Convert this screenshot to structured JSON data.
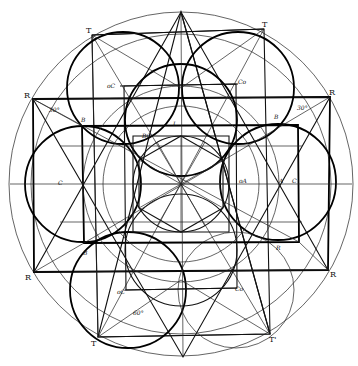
{
  "diagram": {
    "title": "",
    "type": "geometric construction",
    "stroke_color": "#000000",
    "background": "#ffffff",
    "labels": {
      "T_tl": "T",
      "T_tr": "T",
      "T_bl": "T",
      "T_br": "T'",
      "R_tl": "R",
      "R_tr": "R",
      "R_bl": "R",
      "R_br": "R",
      "B_tl": "B",
      "B_tr": "B",
      "B_bl": "B",
      "B_br": "R",
      "oC_top": "oC",
      "Co_top": "Co",
      "oC_bot": "oC",
      "Co_bot": "Co",
      "BC": "BC",
      "L": "L",
      "oA": "oA",
      "A": "A",
      "C_right": "C",
      "C_left": "C",
      "deg_left": "30°",
      "deg_right": "30°",
      "deg_bottom": "60°"
    }
  }
}
